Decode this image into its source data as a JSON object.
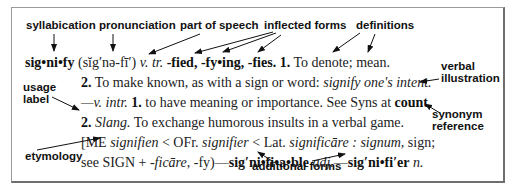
{
  "annotations": {
    "syllabication": "syllabication",
    "pronunciation": "pronunciation",
    "part_of_speech": "part of speech",
    "inflected_forms": "inflected forms",
    "definitions": "definitions",
    "verbal_illustration_1": "verbal",
    "verbal_illustration_2": "illustration",
    "usage_label_1": "usage",
    "usage_label_2": "label",
    "synonym_reference_1": "synonym",
    "synonym_reference_2": "reference",
    "etymology": "etymology",
    "additional_forms": "additional forms"
  },
  "entry": {
    "line1": {
      "headword": "sig•ni•fy",
      "pronunciation": "(sĭg′nə-fī′)",
      "pos": "v. tr.",
      "inflections": "-fied, -fy•ing, -fies.",
      "def_num": "1.",
      "def_text": "To denote; mean."
    },
    "line2": {
      "def_num": "2.",
      "def_text": "To make known, as with a sign or word:",
      "illustration": "signify one's intent."
    },
    "line3": {
      "dash_pos": "—v. intr.",
      "def_num": "1.",
      "def_text": "to have meaning or importance. See Syns at",
      "syn_ref": "count",
      "end": "."
    },
    "line4": {
      "def_num": "2.",
      "label": "Slang.",
      "def_text": "To exchange humorous insults in a verbal game."
    },
    "line5": {
      "open": "[ME",
      "w1": "signifien",
      "t1": "< OFr.",
      "w2": "signifier",
      "t2": "< Lat.",
      "w3": "significāre",
      "t3": ":",
      "w4": "signum,",
      "t4": "sign;"
    },
    "line6": {
      "t1": "see SIGN +",
      "w1": "-ficāre,",
      "t2": "-fy)—",
      "form1": "sig′ni•fi•a•ble",
      "pos1": "adj.",
      "dash": "—",
      "form2": "sig′ni•fi′er",
      "pos2": "n."
    }
  }
}
